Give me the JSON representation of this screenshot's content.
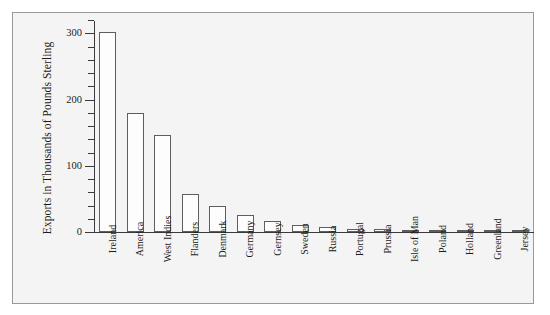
{
  "chart_data": {
    "type": "bar",
    "title": "",
    "subtitle": "",
    "xlabel": "",
    "ylabel": "Exports in Thousands of Pounds Sterling",
    "ylim": [
      0,
      320
    ],
    "yticks_major": [
      0,
      100,
      200,
      300
    ],
    "ytick_labels": [
      "0",
      "100",
      "200",
      "300"
    ],
    "minor_tick_step": 20,
    "grid": false,
    "legend": "none",
    "bar_fill_color": "#fdfdfd",
    "bar_edge_color": "#5e5e5e",
    "panel_background": "#f4f4f4",
    "axis_color": "#3a3a3a",
    "categories": [
      "Ireland",
      "America",
      "West Indies",
      "Flanders",
      "Denmark",
      "Germany",
      "Gernsey",
      "Sweden",
      "Russia",
      "Portugal",
      "Prussia",
      "Isle of Man",
      "Poland",
      "Holland",
      "Greenland",
      "Jersey"
    ],
    "values": [
      302,
      180,
      147,
      57,
      40,
      26,
      17,
      10,
      8,
      5,
      5,
      3,
      3,
      0,
      0,
      0
    ]
  }
}
